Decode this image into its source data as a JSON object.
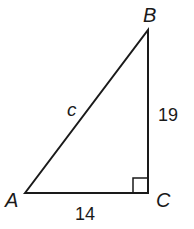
{
  "diagram": {
    "type": "right-triangle",
    "vertices": {
      "A": {
        "label": "A"
      },
      "B": {
        "label": "B"
      },
      "C": {
        "label": "C"
      }
    },
    "sides": {
      "hypotenuse": {
        "label": "c"
      },
      "BC": {
        "label": "19"
      },
      "AC": {
        "label": "14"
      }
    },
    "right_angle_at": "C",
    "stroke_color": "#1a1a1a"
  }
}
